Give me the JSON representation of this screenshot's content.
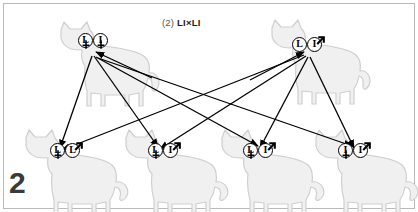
{
  "figure": {
    "panel_number": "2",
    "title_prefix": "(2)",
    "title_cross": "LI×LI",
    "title_full": "(2) LI×LI",
    "background_color": "#ffffff",
    "border_color": "#b9b9b9",
    "ink_color": "#000000",
    "cat_fill_color": "#f0f0f0",
    "cat_outline_color": "#cfcfcf",
    "number_color": "#3a3a3a"
  },
  "parents": [
    {
      "id": "parent-female",
      "role": "mother",
      "sex": "female",
      "sex_symbol": "♀",
      "genotype": "LI",
      "alleles": [
        {
          "letter": "L",
          "sex_symbol": "♀"
        },
        {
          "letter": "I",
          "sex_symbol": "♀"
        }
      ]
    },
    {
      "id": "parent-male",
      "role": "father",
      "sex": "male",
      "sex_symbol": "♂",
      "genotype": "LI",
      "alleles": [
        {
          "letter": "L",
          "sex_symbol": "♂"
        },
        {
          "letter": "I",
          "sex_symbol": "♂"
        }
      ]
    }
  ],
  "offspring": [
    {
      "id": "offspring-1",
      "genotype": "LL",
      "alleles": [
        {
          "letter": "L",
          "sex_symbol": "♀"
        },
        {
          "letter": "L",
          "sex_symbol": "♂"
        }
      ]
    },
    {
      "id": "offspring-2",
      "genotype": "LI",
      "alleles": [
        {
          "letter": "L",
          "sex_symbol": "♀"
        },
        {
          "letter": "I",
          "sex_symbol": "♂"
        }
      ]
    },
    {
      "id": "offspring-3",
      "genotype": "LI",
      "alleles": [
        {
          "letter": "L",
          "sex_symbol": "♀"
        },
        {
          "letter": "I",
          "sex_symbol": "♂"
        }
      ]
    },
    {
      "id": "offspring-4",
      "genotype": "II",
      "alleles": [
        {
          "letter": "I",
          "sex_symbol": "♀"
        },
        {
          "letter": "I",
          "sex_symbol": "♂"
        }
      ]
    }
  ]
}
